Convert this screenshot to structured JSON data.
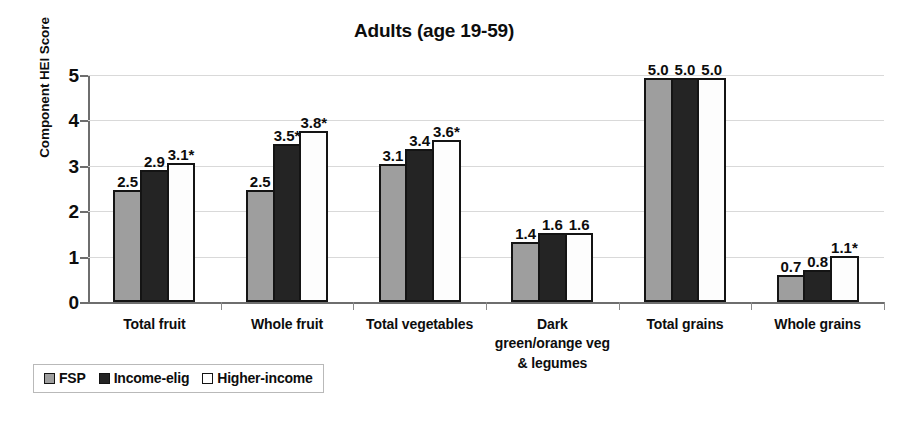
{
  "chart_data": {
    "type": "bar",
    "title": "Adults (age 19-59)",
    "xlabel": "",
    "ylabel": "Component HEI Score",
    "ylim": [
      0,
      5
    ],
    "yticks": [
      "0",
      "1",
      "2",
      "3",
      "4",
      "5"
    ],
    "grid": true,
    "legend_position": "bottom-left",
    "categories": [
      "Total fruit",
      "Whole fruit",
      "Total vegetables",
      "Dark\ngreen/orange veg\n& legumes",
      "Total grains",
      "Whole grains"
    ],
    "category_lines": [
      [
        "Total fruit"
      ],
      [
        "Whole fruit"
      ],
      [
        "Total vegetables"
      ],
      [
        "Dark",
        "green/orange veg",
        "& legumes"
      ],
      [
        "Total grains"
      ],
      [
        "Whole grains"
      ]
    ],
    "series": [
      {
        "name": "FSP",
        "color": "#9e9e9e",
        "values": [
          2.5,
          2.5,
          3.1,
          1.4,
          5.0,
          0.7
        ],
        "labels": [
          "2.5",
          "2.5",
          "3.1",
          "1.4",
          "5.0",
          "0.7"
        ]
      },
      {
        "name": "Income-elig",
        "color": "#242424",
        "values": [
          2.9,
          3.5,
          3.4,
          1.6,
          5.0,
          0.8
        ],
        "labels": [
          "2.9",
          "3.5*",
          "3.4",
          "1.6",
          "5.0",
          "0.8"
        ]
      },
      {
        "name": "Higher-income",
        "color": "#ffffff",
        "values": [
          3.1,
          3.8,
          3.6,
          1.6,
          5.0,
          1.1
        ],
        "labels": [
          "3.1*",
          "3.8*",
          "3.6*",
          "1.6",
          "5.0",
          "1.1*"
        ]
      }
    ],
    "bar_plot_values": [
      [
        2.47,
        2.47,
        3.05,
        1.33,
        4.93,
        0.6
      ],
      [
        2.9,
        3.48,
        3.37,
        1.52,
        4.93,
        0.71
      ],
      [
        3.07,
        3.76,
        3.56,
        1.52,
        4.93,
        1.02
      ]
    ]
  },
  "legend": {
    "items": [
      {
        "label": "FSP",
        "swatch": "s0"
      },
      {
        "label": "Income-elig",
        "swatch": "s1"
      },
      {
        "label": "Higher-income",
        "swatch": "s2"
      }
    ]
  }
}
